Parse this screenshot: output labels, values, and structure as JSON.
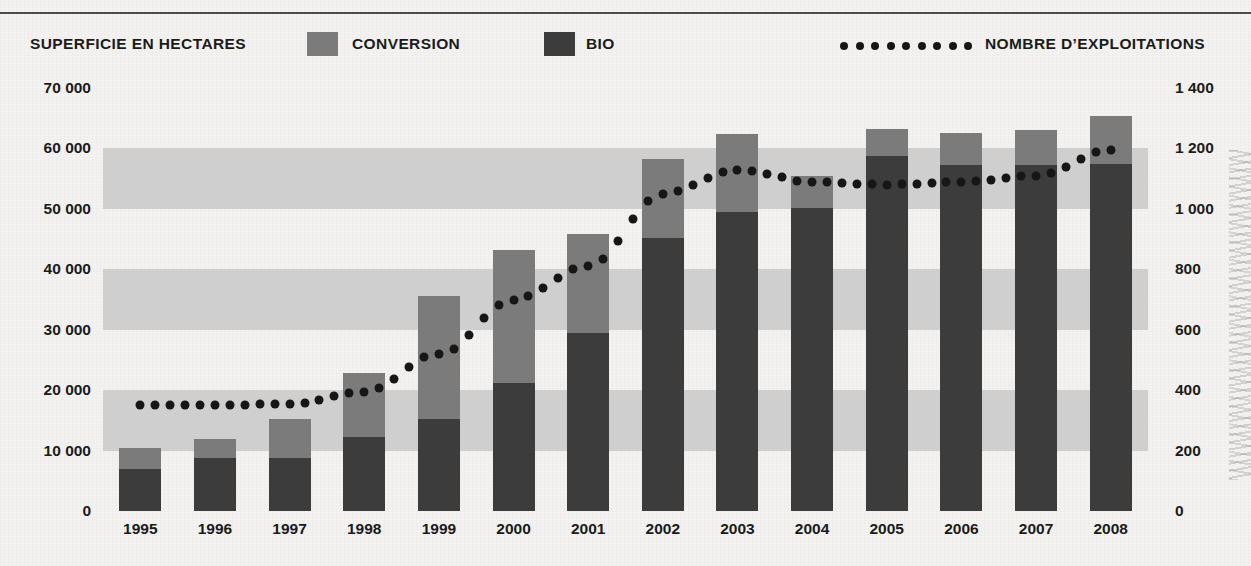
{
  "legend": {
    "title": "SUPERFICIE EN HECTARES",
    "conversion_label": "CONVERSION",
    "bio_label": "BIO",
    "count_label": "NOMBRE D’EXPLOITATIONS",
    "conversion_color": "#7b7b7b",
    "bio_color": "#3c3c3c",
    "dot_color": "#161616",
    "dot_count": 9
  },
  "axis": {
    "left_ticks": [
      "70 000",
      "60 000",
      "50 000",
      "40 000",
      "30 000",
      "20 000",
      "10 000",
      "0"
    ],
    "right_ticks": [
      "1 400",
      "1 200",
      "1 000",
      "800",
      "600",
      "400",
      "200",
      "0"
    ]
  },
  "chart_data": {
    "type": "bar",
    "title": "",
    "xlabel": "",
    "ylabel": "SUPERFICIE EN HECTARES",
    "ylabel_right": "NOMBRE D’EXPLOITATIONS",
    "categories": [
      "1995",
      "1996",
      "1997",
      "1998",
      "1999",
      "2000",
      "2001",
      "2002",
      "2003",
      "2004",
      "2005",
      "2006",
      "2007",
      "2008"
    ],
    "ylim": [
      0,
      70000
    ],
    "ylim_right": [
      0,
      1400
    ],
    "grid": "alternating-bands",
    "legend_position": "top",
    "stacked": true,
    "series": [
      {
        "name": "BIO",
        "kind": "bar",
        "color": "#3c3c3c",
        "axis": "left",
        "values": [
          7000,
          8700,
          8800,
          12200,
          15300,
          21200,
          29400,
          45100,
          49400,
          50200,
          58700,
          57200,
          57300,
          57500
        ]
      },
      {
        "name": "CONVERSION",
        "kind": "bar",
        "color": "#7b7b7b",
        "axis": "left",
        "values": [
          3500,
          3300,
          6500,
          10600,
          20200,
          22000,
          16400,
          13100,
          13000,
          5200,
          4500,
          5400,
          5800,
          7800
        ]
      },
      {
        "name": "NOMBRE D’EXPLOITATIONS",
        "kind": "dotted-line",
        "color": "#161616",
        "axis": "right",
        "values": [
          350,
          350,
          355,
          395,
          520,
          700,
          810,
          1050,
          1130,
          1090,
          1080,
          1090,
          1110,
          1195
        ]
      }
    ],
    "totals": [
      10500,
      12000,
      15300,
      22800,
      35500,
      43200,
      45800,
      58200,
      62400,
      55400,
      63200,
      62600,
      63100,
      65300
    ]
  }
}
